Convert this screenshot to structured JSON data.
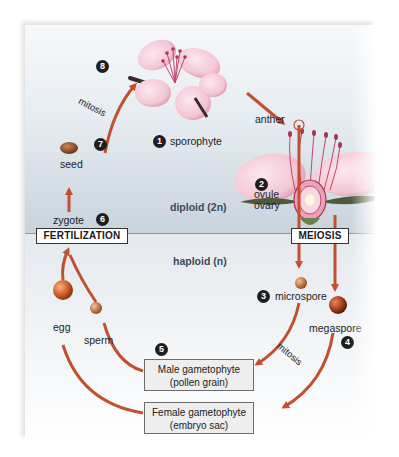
{
  "diagram": {
    "zones": {
      "diploid": "diploid (2n)",
      "haploid": "haploid (n)"
    },
    "phases": {
      "fertilization": "FERTILIZATION",
      "meiosis": "MEIOSIS"
    },
    "stages": [
      {
        "num": "1",
        "label": "sporophyte"
      },
      {
        "num": "2",
        "label": ""
      },
      {
        "num": "3",
        "label": "microspore"
      },
      {
        "num": "4",
        "label": "megaspore"
      },
      {
        "num": "5",
        "label": ""
      },
      {
        "num": "6",
        "label": "zygote"
      },
      {
        "num": "7",
        "label": "seed"
      },
      {
        "num": "8",
        "label": ""
      }
    ],
    "flower_parts": {
      "anther": "anther",
      "ovule": "ovule",
      "ovary": "ovary"
    },
    "gametes": {
      "egg": "egg",
      "sperm": "sperm"
    },
    "gametophytes": {
      "male_line1": "Male gametophyte",
      "male_line2": "(pollen grain)",
      "female_line1": "Female gametophyte",
      "female_line2": "(embryo sac)"
    },
    "processes": {
      "mitosis_top": "mitosis",
      "mitosis_bottom": "mitosis"
    },
    "colors": {
      "arrow": "#c2502f",
      "diploid_bg": "#c9d3dc",
      "haploid_bg": "#f2f4f6",
      "petal": "#f3c6d4",
      "petal_edge": "#d98aa5",
      "stamen": "#c0476a",
      "seed": "#8a4a2a",
      "egg": "#d2602a",
      "badge": "#1e1e1e"
    }
  }
}
